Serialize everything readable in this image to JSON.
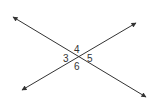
{
  "diagram": {
    "type": "intersecting-lines",
    "intersection": {
      "x": 79,
      "y": 57
    },
    "lines": [
      {
        "name": "line-a",
        "from": {
          "x": 13,
          "y": 17
        },
        "to": {
          "x": 146,
          "y": 97
        },
        "arrows": "both"
      },
      {
        "name": "line-b",
        "from": {
          "x": 22,
          "y": 90
        },
        "to": {
          "x": 136,
          "y": 23
        },
        "arrows": "both"
      }
    ],
    "angle_labels": [
      {
        "id": "angle-3",
        "text": "3",
        "x": 63,
        "y": 62
      },
      {
        "id": "angle-4",
        "text": "4",
        "x": 74,
        "y": 53
      },
      {
        "id": "angle-5",
        "text": "5",
        "x": 87,
        "y": 62
      },
      {
        "id": "angle-6",
        "text": "6",
        "x": 74,
        "y": 70
      }
    ],
    "colors": {
      "line": "#333333",
      "label": "#333333",
      "background": "#ffffff"
    }
  }
}
